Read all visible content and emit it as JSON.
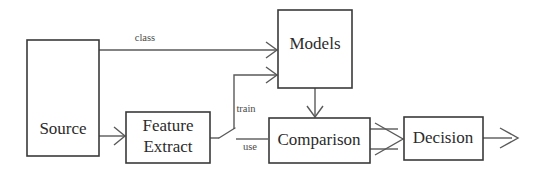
{
  "diagram": {
    "canvas": {
      "width": 536,
      "height": 178
    },
    "colors": {
      "background": "#ffffff",
      "box_stroke": "#3a3a3a",
      "edge_stroke": "#5a5a5a",
      "node_text": "#2b2b2b",
      "edge_text": "#4a4a4a"
    },
    "nodes": [
      {
        "id": "source",
        "label": "Source",
        "label_line1": "Source",
        "label_line2": ""
      },
      {
        "id": "feature",
        "label": "Feature Extract",
        "label_line1": "Feature",
        "label_line2": "Extract"
      },
      {
        "id": "models",
        "label": "Models",
        "label_line1": "Models",
        "label_line2": ""
      },
      {
        "id": "comparison",
        "label": "Comparison",
        "label_line1": "Comparison",
        "label_line2": ""
      },
      {
        "id": "decision",
        "label": "Decision",
        "label_line1": "Decision",
        "label_line2": ""
      }
    ],
    "edges": [
      {
        "id": "source-to-models",
        "label": "class",
        "from": "source",
        "to": "models"
      },
      {
        "id": "source-to-feature",
        "label": "",
        "from": "source",
        "to": "feature"
      },
      {
        "id": "feature-to-models",
        "label": "train",
        "from": "feature",
        "to": "models"
      },
      {
        "id": "feature-to-comparison",
        "label": "use",
        "from": "feature",
        "to": "comparison"
      },
      {
        "id": "models-to-comparison",
        "label": "",
        "from": "models",
        "to": "comparison"
      },
      {
        "id": "comparison-to-decision",
        "label": "",
        "from": "comparison",
        "to": "decision"
      },
      {
        "id": "decision-output",
        "label": "",
        "from": "decision",
        "to": ""
      }
    ]
  }
}
